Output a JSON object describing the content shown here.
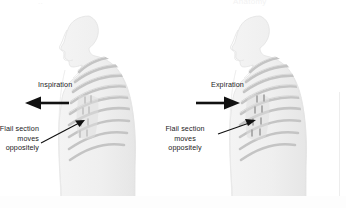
{
  "figure": {
    "title_top_left_cut": "..",
    "title_top_right_cut": "Anatomy",
    "background_color": "#ffffff",
    "ink_color": "#1b1b1b",
    "body_fill": "#f2f2f2",
    "bone_color": "#c8c8c8",
    "bone_shade": "#b0b0b0"
  },
  "panels": [
    {
      "id": "inspiration",
      "phase_label": "Inspiration",
      "arrow_direction": "left",
      "arrow_name": "inspiration-arrow-left",
      "callout": {
        "line1": "Flail section",
        "line2": "moves",
        "line3": "oppositely",
        "align": "right"
      },
      "flail_segment_label": "flail-segment",
      "rib_count": 9
    },
    {
      "id": "expiration",
      "phase_label": "Expiration",
      "arrow_direction": "right",
      "arrow_name": "expiration-arrow-right",
      "callout": {
        "line1": "Flail section",
        "line2": "moves",
        "line3": "oppositely",
        "align": "center"
      },
      "flail_segment_label": "flail-segment",
      "rib_count": 9
    }
  ]
}
